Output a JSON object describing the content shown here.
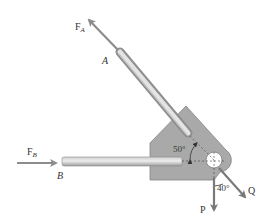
{
  "diagram": {
    "forces": {
      "FA": {
        "label": "F",
        "subscript": "A"
      },
      "FB": {
        "label": "F",
        "subscript": "B"
      },
      "P": {
        "label": "P"
      },
      "Q": {
        "label": "Q"
      }
    },
    "points": {
      "A": "A",
      "B": "B"
    },
    "angles": {
      "rod_A_to_horizontal": "50°",
      "Q_to_vertical": "40°"
    },
    "colors": {
      "plate_fill": "#a9a9a9",
      "plate_edge": "#7f7f7f",
      "rod_light": "#e6e6e6",
      "rod_dark": "#9a9a9a",
      "arrow": "#8c8c8c",
      "label_text": "#333333",
      "background": "#ffffff"
    }
  }
}
